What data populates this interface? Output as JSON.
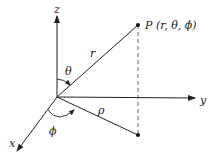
{
  "diagram": {
    "axes": {
      "x": "x",
      "y": "y",
      "z": "z"
    },
    "point_label": "P (r, θ, ϕ)",
    "labels": {
      "r": "r",
      "theta": "θ",
      "phi": "ϕ",
      "rho": "ρ"
    },
    "colors": {
      "line": "#222222",
      "background": "#ffffff"
    }
  }
}
